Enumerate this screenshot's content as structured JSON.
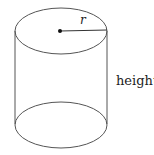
{
  "diagram": {
    "shape": "cylinder",
    "labels": {
      "radius": "r",
      "height": "height"
    },
    "colors": {
      "stroke": "#555555",
      "text": "#222222",
      "center_dot": "#111111",
      "background": "#ffffff"
    }
  }
}
